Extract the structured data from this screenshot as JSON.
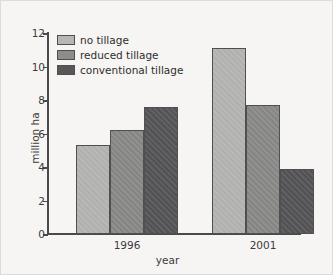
{
  "chart_data": {
    "type": "bar",
    "title": "",
    "xlabel": "year",
    "ylabel": "million ha",
    "categories": [
      "1996",
      "2001"
    ],
    "series": [
      {
        "name": "no tillage",
        "values": [
          5.3,
          11.1
        ],
        "color": "#b6b6b4"
      },
      {
        "name": "reduced tillage",
        "values": [
          6.2,
          7.7
        ],
        "color": "#8c8c8a"
      },
      {
        "name": "conventional tillage",
        "values": [
          7.6,
          3.9
        ],
        "color": "#58585a"
      }
    ],
    "ylim": [
      0,
      12
    ],
    "yticks": [
      0,
      2,
      4,
      6,
      8,
      10,
      12
    ],
    "ytick_labels": [
      "0",
      "2",
      "4",
      "6",
      "8",
      "10",
      "12"
    ],
    "grid": false,
    "legend_position": "top-left"
  },
  "figure": {
    "background_color": "#f6f5f3",
    "axis_color": "#4a4a4a"
  }
}
